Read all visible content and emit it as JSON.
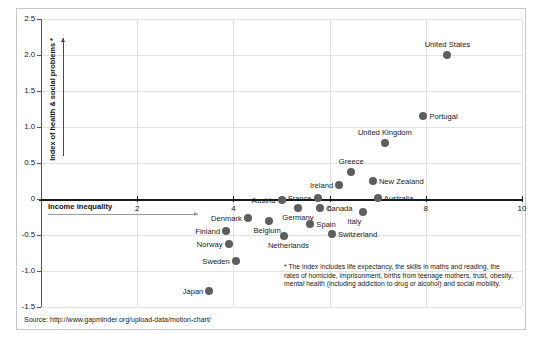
{
  "figure": {
    "background": "#ffffff",
    "frame_color": "#c9c9c9",
    "dot_color": "#5e5e5e",
    "grid_color": "#e3e3e3",
    "axis_color": "#1a1a1a"
  },
  "axes": {
    "y_caption": "Index of health & social problems *",
    "x_caption": "Income inequality",
    "y_ticks": [
      "2.5",
      "2.0",
      "1.5",
      "1.0",
      "0.5",
      "0",
      "-0.5",
      "-1.0",
      "-1.5"
    ],
    "y_tick_values": [
      2.5,
      2.0,
      1.5,
      1.0,
      0.5,
      0,
      -0.5,
      -1.0,
      -1.5
    ],
    "x_ticks": [
      "2",
      "4",
      "6",
      "8",
      "10"
    ],
    "x_tick_values": [
      2,
      4,
      6,
      8,
      10
    ]
  },
  "footnote": "* The index includes life expectancy, the skills in maths and reading, the rates of homicide, imprisonment, births from teenage mothers, trust, obesity, mental health (including addiction to drug or alcohol) and social mobility.",
  "source": "Source: http://www.gapminder.org/upload-data/motion-chart/",
  "chart_data": {
    "type": "scatter",
    "title": "",
    "xlabel": "Income inequality",
    "ylabel": "Index of health & social problems *",
    "xlim": [
      0,
      10
    ],
    "ylim": [
      -1.5,
      2.5
    ],
    "grid": true,
    "legend": "none",
    "points": [
      {
        "label": "United States",
        "x": 8.45,
        "y": 2.0,
        "label_pos": "above"
      },
      {
        "label": "Portugal",
        "x": 7.95,
        "y": 1.15,
        "label_pos": "right"
      },
      {
        "label": "United Kingdom",
        "x": 7.15,
        "y": 0.78,
        "label_pos": "above"
      },
      {
        "label": "Greece",
        "x": 6.45,
        "y": 0.38,
        "label_pos": "above"
      },
      {
        "label": "New Zealand",
        "x": 6.9,
        "y": 0.25,
        "label_pos": "right"
      },
      {
        "label": "Ireland",
        "x": 6.2,
        "y": 0.2,
        "label_pos": "left"
      },
      {
        "label": "Australia",
        "x": 7.0,
        "y": 0.02,
        "label_pos": "right"
      },
      {
        "label": "France",
        "x": 5.75,
        "y": 0.02,
        "label_pos": "left"
      },
      {
        "label": "Austria",
        "x": 5.0,
        "y": -0.02,
        "label_pos": "left"
      },
      {
        "label": "Canada",
        "x": 5.8,
        "y": -0.12,
        "label_pos": "right"
      },
      {
        "label": "Italy",
        "x": 6.7,
        "y": -0.18,
        "label_pos": "below"
      },
      {
        "label": "Germany",
        "x": 5.35,
        "y": -0.12,
        "label_pos": "below"
      },
      {
        "label": "Denmark",
        "x": 4.3,
        "y": -0.26,
        "label_pos": "left"
      },
      {
        "label": "Belgium",
        "x": 4.75,
        "y": -0.3,
        "label_pos": "below"
      },
      {
        "label": "Spain",
        "x": 5.6,
        "y": -0.35,
        "label_pos": "right"
      },
      {
        "label": "Finland",
        "x": 3.85,
        "y": -0.44,
        "label_pos": "left"
      },
      {
        "label": "Switzerland",
        "x": 6.05,
        "y": -0.48,
        "label_pos": "right"
      },
      {
        "label": "Netherlands",
        "x": 5.05,
        "y": -0.52,
        "label_pos": "below"
      },
      {
        "label": "Norway",
        "x": 3.9,
        "y": -0.62,
        "label_pos": "left"
      },
      {
        "label": "Sweden",
        "x": 4.05,
        "y": -0.86,
        "label_pos": "left"
      },
      {
        "label": "Japan",
        "x": 3.5,
        "y": -1.28,
        "label_pos": "left"
      }
    ]
  }
}
